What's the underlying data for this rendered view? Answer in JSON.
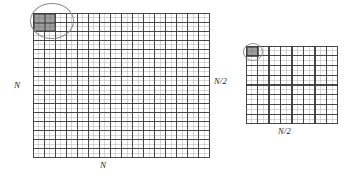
{
  "figure": {
    "background_color": "#ffffff",
    "line_color_major": "#3a3a3a",
    "line_color_minor": "#b5b5b5",
    "shade_color": "#7a7a7a",
    "circle_color": "#8c8c8c",
    "text_color": "#1c1c1c"
  },
  "panels": [
    {
      "id": "fine-grid",
      "name": "fine-mesh",
      "left": 33,
      "top": 13,
      "width": 177,
      "height": 145,
      "major_cols": 16,
      "major_rows": 16,
      "subdivisions": 2,
      "label_left": "N",
      "label_bottom": "N",
      "label_left_x": 14,
      "label_left_y": 81,
      "label_bottom_x": 100,
      "label_bottom_y": 161,
      "highlight": {
        "name": "shaded-cell-block",
        "cols": 2,
        "rows": 2,
        "offset_col": 0,
        "offset_row": 0
      },
      "circle": {
        "name": "zoom-circle",
        "cx": 52,
        "cy": 21,
        "rx": 22,
        "ry": 18
      }
    },
    {
      "id": "coarse-grid",
      "name": "coarse-mesh",
      "left": 246,
      "top": 46,
      "width": 92,
      "height": 78,
      "major_cols": 8,
      "major_rows": 8,
      "subdivisions": 2,
      "label_left": "N/2",
      "label_bottom": "N/2",
      "label_left_x": 214,
      "label_left_y": 77,
      "label_bottom_x": 278,
      "label_bottom_y": 127,
      "highlight": {
        "name": "shaded-cell-block",
        "cols": 1,
        "rows": 1,
        "offset_col": 0,
        "offset_row": 0
      },
      "circle": {
        "name": "zoom-circle",
        "cx": 253,
        "cy": 52,
        "rx": 10,
        "ry": 9
      }
    }
  ],
  "labels": {
    "fine_height": "N",
    "fine_width": "N",
    "coarse_height": "N/2",
    "coarse_width": "N/2"
  }
}
